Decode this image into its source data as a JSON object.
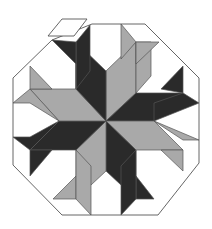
{
  "figure": {
    "title": "Octagonal eight-pointed star tiling with one detached rhombus",
    "colors": {
      "dark": "#2a2a2a",
      "gray": "#a9a9a9",
      "white": "#ffffff",
      "stroke": "#555555"
    },
    "center": [
      106,
      121
    ],
    "octagon": [
      [
        92,
        24
      ],
      [
        145,
        24
      ],
      [
        199,
        78
      ],
      [
        199,
        163
      ],
      [
        158,
        215
      ],
      [
        62,
        215
      ],
      [
        13,
        165
      ],
      [
        13,
        78
      ],
      [
        52,
        40
      ]
    ],
    "detached_piece": {
      "shape": "rhombus",
      "fill": "white",
      "points": [
        [
          62,
          19
        ],
        [
          87,
          19
        ],
        [
          74,
          36
        ],
        [
          48,
          36
        ]
      ]
    },
    "tiles": [
      {
        "fill": "gray",
        "points": [
          [
            106,
            121
          ],
          [
            106,
            71
          ],
          [
            136,
            42
          ],
          [
            136,
            93
          ]
        ]
      },
      {
        "fill": "dark",
        "points": [
          [
            106,
            121
          ],
          [
            136,
            93
          ],
          [
            183,
            93
          ],
          [
            154,
            121
          ]
        ]
      },
      {
        "fill": "gray",
        "points": [
          [
            106,
            121
          ],
          [
            154,
            121
          ],
          [
            183,
            150
          ],
          [
            136,
            150
          ]
        ]
      },
      {
        "fill": "dark",
        "points": [
          [
            106,
            121
          ],
          [
            136,
            150
          ],
          [
            136,
            199
          ],
          [
            106,
            171
          ]
        ]
      },
      {
        "fill": "gray",
        "points": [
          [
            106,
            121
          ],
          [
            106,
            171
          ],
          [
            76,
            199
          ],
          [
            76,
            150
          ]
        ]
      },
      {
        "fill": "dark",
        "points": [
          [
            106,
            121
          ],
          [
            76,
            150
          ],
          [
            30,
            150
          ],
          [
            59,
            121
          ]
        ]
      },
      {
        "fill": "gray",
        "points": [
          [
            106,
            121
          ],
          [
            59,
            121
          ],
          [
            30,
            89
          ],
          [
            76,
            89
          ]
        ]
      },
      {
        "fill": "dark",
        "points": [
          [
            106,
            121
          ],
          [
            76,
            89
          ],
          [
            76,
            42
          ],
          [
            106,
            71
          ]
        ]
      },
      {
        "fill": "dark",
        "points": [
          [
            76,
            42
          ],
          [
            90,
            25
          ],
          [
            90,
            71
          ],
          [
            76,
            89
          ]
        ]
      },
      {
        "fill": "dark",
        "points": [
          [
            52,
            40
          ],
          [
            76,
            42
          ],
          [
            76,
            89
          ],
          [
            76,
            64
          ]
        ]
      },
      {
        "fill": "gray",
        "points": [
          [
            136,
            42
          ],
          [
            136,
            93
          ],
          [
            151,
            76
          ],
          [
            151,
            42
          ]
        ]
      },
      {
        "fill": "gray",
        "points": [
          [
            121,
            24
          ],
          [
            136,
            42
          ],
          [
            121,
            59
          ]
        ]
      },
      {
        "fill": "gray",
        "points": [
          [
            136,
            42
          ],
          [
            159,
            42
          ],
          [
            136,
            64
          ]
        ]
      },
      {
        "fill": "dark",
        "points": [
          [
            183,
            93
          ],
          [
            183,
            66
          ],
          [
            161,
            89
          ]
        ]
      },
      {
        "fill": "dark",
        "points": [
          [
            183,
            93
          ],
          [
            199,
            103
          ],
          [
            154,
            121
          ],
          [
            154,
            103
          ]
        ]
      },
      {
        "fill": "gray",
        "points": [
          [
            183,
            150
          ],
          [
            183,
            171
          ],
          [
            161,
            150
          ]
        ]
      },
      {
        "fill": "gray",
        "points": [
          [
            154,
            121
          ],
          [
            183,
            140
          ],
          [
            199,
            140
          ]
        ]
      },
      {
        "fill": "dark",
        "points": [
          [
            136,
            199
          ],
          [
            154,
            199
          ],
          [
            136,
            176
          ]
        ]
      },
      {
        "fill": "dark",
        "points": [
          [
            121,
            215
          ],
          [
            136,
            199
          ],
          [
            136,
            150
          ],
          [
            121,
            166
          ]
        ]
      },
      {
        "fill": "gray",
        "points": [
          [
            76,
            199
          ],
          [
            53,
            199
          ],
          [
            76,
            176
          ]
        ]
      },
      {
        "fill": "gray",
        "points": [
          [
            91,
            215
          ],
          [
            76,
            199
          ],
          [
            76,
            150
          ],
          [
            91,
            166
          ]
        ]
      },
      {
        "fill": "dark",
        "points": [
          [
            30,
            150
          ],
          [
            30,
            176
          ],
          [
            52,
            150
          ]
        ]
      },
      {
        "fill": "dark",
        "points": [
          [
            13,
            137
          ],
          [
            30,
            150
          ],
          [
            59,
            121
          ],
          [
            30,
            137
          ]
        ]
      },
      {
        "fill": "gray",
        "points": [
          [
            30,
            89
          ],
          [
            30,
            66
          ],
          [
            52,
            89
          ]
        ]
      },
      {
        "fill": "gray",
        "points": [
          [
            13,
            103
          ],
          [
            30,
            89
          ],
          [
            59,
            121
          ],
          [
            30,
            103
          ]
        ]
      }
    ]
  }
}
